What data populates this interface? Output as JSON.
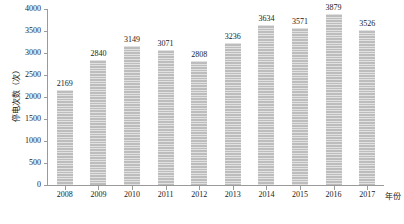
{
  "chart_data": {
    "type": "bar",
    "title": "",
    "subtitle": "",
    "xlabel": "年份",
    "ylabel": "停电次数（次）",
    "categories": [
      "2008",
      "2009",
      "2010",
      "2011",
      "2012",
      "2013",
      "2014",
      "2015",
      "2016",
      "2017"
    ],
    "values": [
      2169,
      2840,
      3149,
      3071,
      2808,
      3236,
      3634,
      3571,
      3879,
      3526
    ],
    "data_labels": [
      "2169",
      "2840",
      "3149",
      "3071",
      "2808",
      "3236",
      "3634",
      "3571",
      "3879",
      "3526"
    ],
    "ylim": [
      0,
      4000
    ],
    "yticks": [
      0,
      500,
      1000,
      1500,
      2000,
      2500,
      3000,
      3500,
      4000
    ],
    "ytick_labels": [
      "0",
      "500",
      "1000",
      "1500",
      "2000",
      "2500",
      "3000",
      "3500",
      "4000"
    ],
    "grid": false,
    "legend": null,
    "legend_position": "none",
    "series_color": "#bdbdbd",
    "axis_color": "#9a9a9a",
    "text_color": "#1a1a1a",
    "bar_fill_pattern": "horizontal-hatch"
  }
}
